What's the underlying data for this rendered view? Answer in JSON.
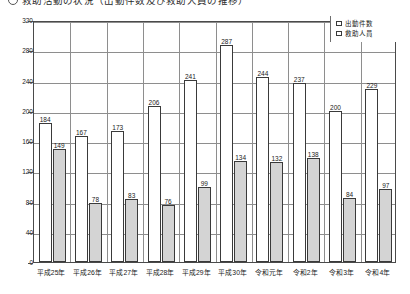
{
  "title": {
    "bullet": "circle-bullet",
    "text": "救助活動の状況（出動件数及び救助人員の推移）"
  },
  "legend": {
    "position": "top-right",
    "items": [
      {
        "swatch": "white-square",
        "label": "出動件数"
      },
      {
        "swatch": "gray-square",
        "label": "救助人員"
      }
    ]
  },
  "axes": {
    "y_ticks": [
      "0",
      "40",
      "80",
      "120",
      "160",
      "200",
      "240",
      "280",
      "320"
    ],
    "x_labels": [
      "平成25年",
      "平成26年",
      "平成27年",
      "平成28年",
      "平成29年",
      "平成30年",
      "令和元年",
      "令和2年",
      "令和3年",
      "令和4年"
    ]
  },
  "colors": {
    "dispatch_bar": "#ffffff",
    "rescue_bar": "#d4d4d4",
    "bar_border": "#3a3a3a",
    "gridline": "#8e8e8e",
    "frame": "#4a4a4a"
  },
  "chart_data": {
    "type": "bar",
    "title": "救助活動の状況（出動件数及び救助人員の推移）",
    "xlabel": "",
    "ylabel": "",
    "ylim": [
      0,
      320
    ],
    "ytick_step": 40,
    "grid": true,
    "legend_position": "top-right",
    "categories": [
      "平成25年",
      "平成26年",
      "平成27年",
      "平成28年",
      "平成29年",
      "平成30年",
      "令和元年",
      "令和2年",
      "令和3年",
      "令和4年"
    ],
    "series": [
      {
        "name": "出動件数",
        "values": [
          184,
          167,
          173,
          206,
          241,
          287,
          244,
          237,
          200,
          229
        ]
      },
      {
        "name": "救助人員",
        "values": [
          149,
          78,
          83,
          76,
          99,
          134,
          132,
          138,
          84,
          97
        ]
      }
    ]
  }
}
